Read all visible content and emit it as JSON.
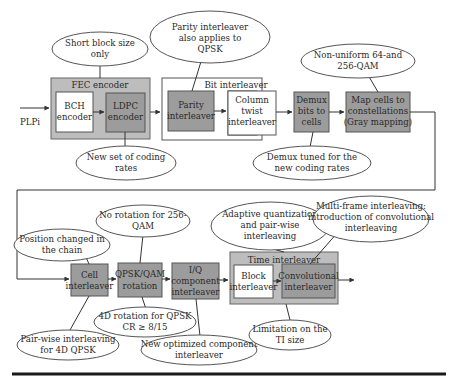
{
  "input_label": "PLPi",
  "groups": {
    "fec": {
      "label": "FEC encoder"
    },
    "bit": {
      "label": "Bit interleaver"
    },
    "time": {
      "label": "Time interleaver"
    }
  },
  "blocks": {
    "bch": [
      "BCH",
      "encoder"
    ],
    "ldpc": [
      "LDPC",
      "encoder"
    ],
    "parity": [
      "Parity",
      "interleaver"
    ],
    "column_twist": [
      "Column",
      "twist",
      "interleaver"
    ],
    "demux": [
      "Demux",
      "bits to",
      "cells"
    ],
    "map_cells": [
      "Map cells to",
      "constellations",
      "(Gray mapping)"
    ],
    "cell_interleaver": [
      "Cell",
      "interleaver"
    ],
    "rotation": [
      "QPSK/QAM",
      "rotation"
    ],
    "iq": [
      "I/Q",
      "component",
      "interleaver"
    ],
    "block_interleaver": [
      "Block",
      "interleaver"
    ],
    "convolutional": [
      "Convolutional",
      "interleaver"
    ]
  },
  "callouts": {
    "short_block": [
      "Short block size",
      "only"
    ],
    "parity_qpsk": [
      "Parity interleaver",
      "also applies to",
      "QPSK"
    ],
    "non_uniform": [
      "Non-uniform 64-and",
      "256-QAM"
    ],
    "coding_rates": [
      "New set of coding",
      "rates"
    ],
    "demux_tuned": [
      "Demux tuned for the",
      "new coding rates"
    ],
    "position_changed": [
      "Position changed in",
      "the chain"
    ],
    "no_rotation": [
      "No rotation for 256-",
      "QAM"
    ],
    "adaptive_quant": [
      "Adaptive quantization",
      "and pair-wise",
      "interleaving"
    ],
    "multi_frame": [
      "Multi-frame interleaving:",
      "introduction of convolutional",
      "interleaving"
    ],
    "rotation_4d": [
      "4D rotation for QPSK",
      "CR ≥ 8/15"
    ],
    "pair_wise": [
      "Pair-wise interleaving",
      "for 4D QPSK"
    ],
    "new_iq": [
      "New optimized component",
      "interleaver"
    ],
    "ti_limit": [
      "Limitation on the",
      "TI size"
    ]
  },
  "colors": {
    "block_dark": "#9c9c9c",
    "group_dark": "#bdbdbd",
    "stroke": "#555555",
    "background": "#ffffff"
  }
}
